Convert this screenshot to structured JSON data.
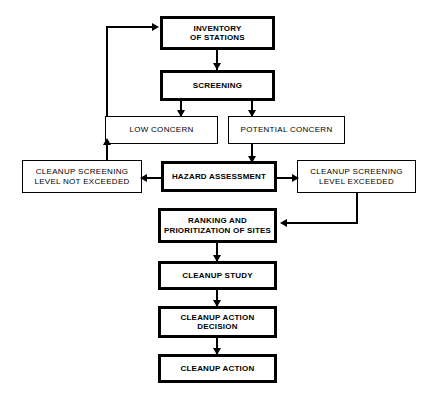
{
  "diagram": {
    "background_color": "#ffffff",
    "line_color": "#000000",
    "nodes": [
      {
        "id": "inventory",
        "label": "INVENTORY\nOF STATIONS"
      },
      {
        "id": "screening",
        "label": "SCREENING"
      },
      {
        "id": "low_concern",
        "label": "LOW CONCERN"
      },
      {
        "id": "potential_concern",
        "label": "POTENTIAL CONCERN"
      },
      {
        "id": "level_not_exceeded",
        "label": "CLEANUP SCREENING\nLEVEL NOT EXCEEDED"
      },
      {
        "id": "hazard_assessment",
        "label": "HAZARD ASSESSMENT"
      },
      {
        "id": "level_exceeded",
        "label": "CLEANUP SCREENING\nLEVEL EXCEEDED"
      },
      {
        "id": "ranking",
        "label": "RANKING AND\nPRIORITIZATION OF SITES"
      },
      {
        "id": "cleanup_study",
        "label": "CLEANUP STUDY"
      },
      {
        "id": "cleanup_decision",
        "label": "CLEANUP ACTION\nDECISION"
      },
      {
        "id": "cleanup_action",
        "label": "CLEANUP ACTION"
      }
    ],
    "edges": [
      {
        "from": "inventory",
        "to": "screening",
        "direction": "down"
      },
      {
        "from": "screening",
        "to": "low_concern",
        "direction": "down"
      },
      {
        "from": "screening",
        "to": "potential_concern",
        "direction": "down"
      },
      {
        "from": "potential_concern",
        "to": "hazard_assessment",
        "direction": "down"
      },
      {
        "from": "hazard_assessment",
        "to": "level_not_exceeded",
        "direction": "left"
      },
      {
        "from": "hazard_assessment",
        "to": "level_exceeded",
        "direction": "right"
      },
      {
        "from": "level_not_exceeded",
        "to": "low_concern",
        "direction": "up"
      },
      {
        "from": "low_concern",
        "to": "inventory",
        "direction": "feedback-left-up"
      },
      {
        "from": "level_exceeded",
        "to": "ranking",
        "direction": "down-left"
      },
      {
        "from": "ranking",
        "to": "cleanup_study",
        "direction": "down"
      },
      {
        "from": "cleanup_study",
        "to": "cleanup_decision",
        "direction": "down"
      },
      {
        "from": "cleanup_decision",
        "to": "cleanup_action",
        "direction": "down"
      }
    ]
  }
}
